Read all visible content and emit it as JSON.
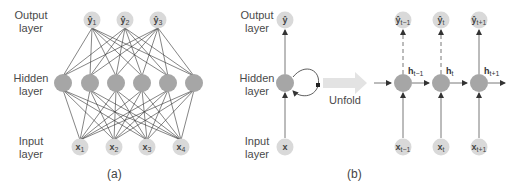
{
  "panel_a": {
    "caption": "(a)",
    "layer_labels": {
      "output": [
        "Output",
        "layer"
      ],
      "hidden": [
        "Hidden",
        "layer"
      ],
      "input": [
        "Input",
        "layer"
      ]
    },
    "output_nodes": [
      {
        "base": "ŷ",
        "sub": "1"
      },
      {
        "base": "ŷ",
        "sub": "2"
      },
      {
        "base": "ŷ",
        "sub": "3"
      }
    ],
    "hidden_node_count": 6,
    "input_nodes": [
      {
        "base": "x",
        "sub": "1"
      },
      {
        "base": "x",
        "sub": "2"
      },
      {
        "base": "x",
        "sub": "3"
      },
      {
        "base": "x",
        "sub": "4"
      }
    ]
  },
  "panel_b": {
    "caption": "(b)",
    "layer_labels": {
      "output": [
        "Output",
        "layer"
      ],
      "hidden": [
        "Hidden",
        "layer"
      ],
      "input": [
        "Input",
        "layer"
      ]
    },
    "folded": {
      "output": "ŷ",
      "input": "x"
    },
    "unfold_label": "Unfold",
    "unrolled": [
      {
        "output": {
          "base": "ŷ",
          "sub": "t−1"
        },
        "hidden": {
          "base": "h",
          "sub": "t−1"
        },
        "input": {
          "base": "x",
          "sub": "t−1"
        },
        "output_link": "dashed"
      },
      {
        "output": {
          "base": "ŷ",
          "sub": "t"
        },
        "hidden": {
          "base": "h",
          "sub": "t"
        },
        "input": {
          "base": "x",
          "sub": "t"
        },
        "output_link": "dashed"
      },
      {
        "output": {
          "base": "ŷ",
          "sub": "t+1"
        },
        "hidden": {
          "base": "h",
          "sub": "t+1"
        },
        "input": {
          "base": "x",
          "sub": "t+1"
        },
        "output_link": "solid"
      }
    ]
  },
  "colors": {
    "io_node": "#d9d9d9",
    "hidden_node": "#a6a6a6",
    "line": "#333333",
    "unfold_arrow": "#e3e3e3"
  }
}
